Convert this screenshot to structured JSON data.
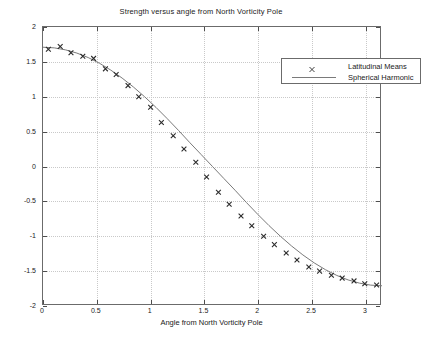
{
  "chart_data": {
    "type": "scatter",
    "title": "Strength versus angle from North Vorticity Pole",
    "xlabel": "Angle from North Vorticity Pole",
    "ylabel": "",
    "xlim": [
      0,
      3.15
    ],
    "ylim": [
      -2,
      2
    ],
    "grid": true,
    "legend_position": "top-right",
    "xticks": [
      0,
      0.5,
      1,
      1.5,
      2,
      2.5,
      3
    ],
    "xtick_labels": [
      "0",
      "0.5",
      "1",
      "1.5",
      "2",
      "2.5",
      "3"
    ],
    "yticks": [
      -2,
      -1.5,
      -1,
      -0.5,
      0,
      0.5,
      1,
      1.5,
      2
    ],
    "ytick_labels": [
      "-2",
      "-1.5",
      "-1",
      "-0.5",
      "0",
      "0.5",
      "1",
      "1.5",
      "2"
    ],
    "series": [
      {
        "name": "Latitudinal Means",
        "marker": "x",
        "color": "#2b2b2b",
        "style": "markers",
        "x": [
          0.05,
          0.16,
          0.26,
          0.37,
          0.47,
          0.58,
          0.68,
          0.79,
          0.89,
          1.0,
          1.1,
          1.21,
          1.31,
          1.42,
          1.52,
          1.63,
          1.73,
          1.84,
          1.94,
          2.05,
          2.15,
          2.26,
          2.36,
          2.47,
          2.57,
          2.68,
          2.78,
          2.89,
          2.99,
          3.1
        ],
        "y": [
          1.68,
          1.72,
          1.63,
          1.58,
          1.55,
          1.4,
          1.32,
          1.16,
          1.0,
          0.85,
          0.63,
          0.44,
          0.25,
          0.06,
          -0.15,
          -0.37,
          -0.54,
          -0.71,
          -0.85,
          -1.0,
          -1.12,
          -1.24,
          -1.34,
          -1.44,
          -1.5,
          -1.56,
          -1.6,
          -1.64,
          -1.68,
          -1.7
        ]
      },
      {
        "name": "Spherical Harmonic",
        "marker": "none",
        "color": "#7a7a7a",
        "style": "line",
        "amplitude": 1.71,
        "function": "1.71*cos(theta)",
        "x": [
          0.0,
          0.105,
          0.21,
          0.315,
          0.42,
          0.525,
          0.63,
          0.735,
          0.84,
          0.945,
          1.05,
          1.155,
          1.26,
          1.365,
          1.47,
          1.575,
          1.68,
          1.785,
          1.89,
          1.995,
          2.1,
          2.205,
          2.31,
          2.415,
          2.52,
          2.625,
          2.73,
          2.835,
          2.94,
          3.045,
          3.15
        ],
        "y": [
          1.71,
          1.701,
          1.672,
          1.626,
          1.562,
          1.48,
          1.382,
          1.268,
          1.14,
          0.999,
          0.847,
          0.685,
          0.516,
          0.341,
          0.171,
          0.0,
          -0.171,
          -0.341,
          -0.516,
          -0.685,
          -0.847,
          -0.999,
          -1.14,
          -1.268,
          -1.382,
          -1.48,
          -1.562,
          -1.626,
          -1.672,
          -1.701,
          -1.71
        ]
      }
    ]
  },
  "legend": {
    "entries": [
      {
        "label": "Latitudinal Means"
      },
      {
        "label": "Spherical Harmonic"
      }
    ]
  }
}
